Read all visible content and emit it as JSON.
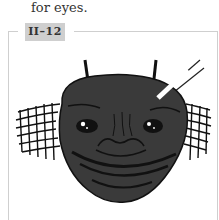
{
  "caption": {
    "text": "for eyes."
  },
  "figure": {
    "label": "II–12",
    "illustration": "fly-face-with-antennae-and-mesh-wings",
    "colors": {
      "face": "#3a3a3a",
      "outline": "#111111",
      "frame": "#cfcfcf",
      "label_bg": "#cfcfcf"
    }
  }
}
